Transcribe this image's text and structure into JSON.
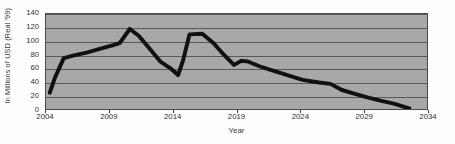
{
  "chart_data": {
    "type": "line",
    "title": "",
    "xlabel": "Year",
    "ylabel": "In Millions of USD (Real '99)",
    "xlim": [
      2004,
      2034
    ],
    "ylim": [
      0,
      140
    ],
    "grid": true,
    "grid_axis": "y",
    "legend_position": "none",
    "x_ticks": [
      2004,
      2009,
      2014,
      2019,
      2024,
      2029,
      2034
    ],
    "y_ticks": [
      0,
      20,
      40,
      60,
      80,
      100,
      120,
      140
    ],
    "series": [
      {
        "name": "Revenue",
        "color": "#111111",
        "line_width": 4,
        "points": [
          [
            2004.3,
            24
          ],
          [
            2004.7,
            46
          ],
          [
            2005.4,
            75
          ],
          [
            2006.2,
            79
          ],
          [
            2007.2,
            83
          ],
          [
            2008.3,
            89
          ],
          [
            2009.3,
            94
          ],
          [
            2009.8,
            97
          ],
          [
            2010.6,
            118
          ],
          [
            2011.3,
            108
          ],
          [
            2012.2,
            88
          ],
          [
            2013.0,
            70
          ],
          [
            2013.8,
            60
          ],
          [
            2014.4,
            50
          ],
          [
            2014.8,
            72
          ],
          [
            2015.3,
            110
          ],
          [
            2016.3,
            111
          ],
          [
            2017.2,
            97
          ],
          [
            2018.0,
            80
          ],
          [
            2018.8,
            65
          ],
          [
            2019.4,
            71
          ],
          [
            2019.9,
            70
          ],
          [
            2020.8,
            63
          ],
          [
            2021.8,
            57
          ],
          [
            2023.0,
            50
          ],
          [
            2024.2,
            43
          ],
          [
            2025.5,
            39
          ],
          [
            2026.4,
            37
          ],
          [
            2027.3,
            28
          ],
          [
            2028.4,
            22
          ],
          [
            2029.3,
            17
          ],
          [
            2030.4,
            12
          ],
          [
            2031.4,
            8
          ],
          [
            2032.2,
            3
          ],
          [
            2032.6,
            1
          ]
        ]
      }
    ]
  },
  "colors": {
    "plot_background": "#a9a9a9",
    "gridline": "#595959",
    "axis": "#4a4a4a",
    "series": "#111111",
    "text": "#2e2e2e",
    "page_background": "#ffffff"
  }
}
